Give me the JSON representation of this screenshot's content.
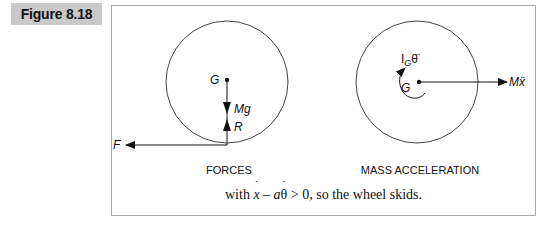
{
  "figure": {
    "label": "Figure 8.18"
  },
  "diagram": {
    "forces_panel": {
      "title": "FORCES",
      "center_label": "G",
      "arrows": [
        {
          "name": "F",
          "direction": "left"
        },
        {
          "name": "Mg",
          "direction": "down"
        },
        {
          "name": "R",
          "direction": "up"
        }
      ],
      "labels": {
        "F": "F",
        "Mg": "Mg",
        "R": "R"
      }
    },
    "mass_acceleration_panel": {
      "title": "MASS ACCELERATION",
      "center_label": "G",
      "moment_label_main": "I",
      "moment_label_sub": "G",
      "moment_label_theta": "θ̈",
      "force_label": "Mẍ"
    }
  },
  "caption": {
    "prefix": "with ",
    "x": "x",
    "minus": " – ",
    "a": "a",
    "theta": "θ",
    "suffix": " > 0, so the wheel skids."
  },
  "colors": {
    "tab_background": "#c9c9c9",
    "border": "#a9a9a9",
    "ink": "#111111"
  }
}
